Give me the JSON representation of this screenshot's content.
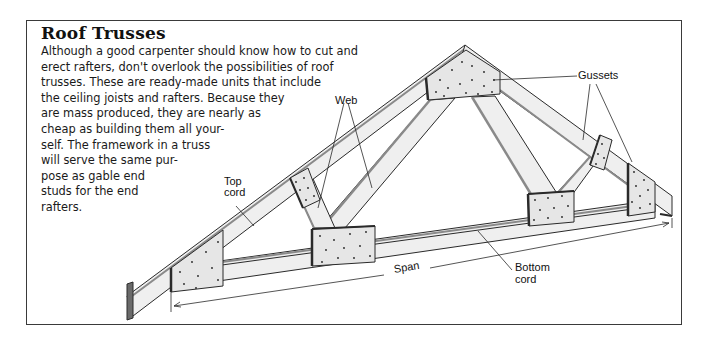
{
  "title": "Roof Trusses",
  "body_lines": [
    "Although a good carpenter should know how to cut and",
    "erect rafters, don't overlook the possibilities of roof",
    "trusses. These are ready-made units that include",
    "the ceiling joists and rafters. Because they",
    "are mass produced, they are nearly as",
    "cheap as building them all your-",
    "self. The framework in a truss",
    "will serve the same pur-",
    "pose as gable end",
    "studs for the end",
    "rafters."
  ],
  "labels": {
    "web": "Web",
    "gussets": "Gussets",
    "top_cord_1": "Top",
    "top_cord_2": "cord",
    "bottom_cord_1": "Bottom",
    "bottom_cord_2": "cord",
    "span": "Span"
  },
  "colors": {
    "line": "#2a2a2a",
    "wood_fill": "#efefef",
    "gusset_fill": "#e6e6e6",
    "edge_shade": "#8a8a8a"
  }
}
